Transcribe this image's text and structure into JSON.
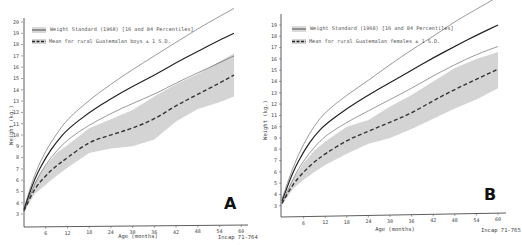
{
  "chart_data": [
    {
      "type": "line",
      "panel": "A",
      "title": "",
      "xlabel": "Age (months)",
      "ylabel": "Weight (kg.)",
      "xlim": [
        0,
        61
      ],
      "ylim": [
        2,
        20
      ],
      "x_ticks": [
        6,
        12,
        18,
        24,
        30,
        36,
        42,
        48,
        54,
        60
      ],
      "y_ticks": [
        3,
        4,
        5,
        6,
        7,
        8,
        9,
        10,
        11,
        12,
        13,
        14,
        15,
        16,
        17,
        18,
        19,
        20
      ],
      "grid": false,
      "legend": [
        "Weight Standard (1968) [16 and 84 Percentiles]",
        "Mean for rural Guatemalan boys ± 1 S.D."
      ],
      "legend_position": "upper left",
      "footer": "Incap 71-764",
      "x": [
        0,
        3,
        6,
        9,
        12,
        18,
        24,
        30,
        36,
        42,
        48,
        54,
        58
      ],
      "series": [
        {
          "name": "Standard 84th percentile",
          "style": "thin solid",
          "values": [
            3.5,
            6.6,
            8.6,
            10.1,
            11.4,
            13.1,
            14.5,
            15.8,
            17.0,
            18.2,
            19.4,
            20.5,
            21.2
          ]
        },
        {
          "name": "Standard 50th percentile",
          "style": "thick solid",
          "values": [
            3.4,
            6.2,
            8.0,
            9.4,
            10.5,
            12.0,
            13.2,
            14.3,
            15.3,
            16.4,
            17.4,
            18.4,
            19.0
          ]
        },
        {
          "name": "Standard 16th percentile",
          "style": "thin solid",
          "values": [
            3.2,
            5.8,
            7.4,
            8.6,
            9.6,
            10.9,
            11.9,
            12.8,
            13.6,
            14.6,
            15.5,
            16.4,
            17.0
          ]
        },
        {
          "name": "Guatemalan boys mean",
          "style": "dashed",
          "values": [
            3.3,
            5.3,
            6.4,
            7.3,
            8.0,
            9.4,
            10.0,
            10.6,
            11.4,
            12.6,
            13.6,
            14.6,
            15.3
          ]
        },
        {
          "name": "Guatemalan boys +1 S.D.",
          "style": "shaded band upper",
          "values": [
            3.4,
            5.8,
            7.3,
            8.4,
            9.1,
            10.6,
            11.4,
            12.2,
            13.4,
            14.5,
            15.4,
            16.5,
            17.2
          ]
        },
        {
          "name": "Guatemalan boys -1 S.D.",
          "style": "shaded band lower",
          "values": [
            3.2,
            4.8,
            5.6,
            6.4,
            7.1,
            8.4,
            8.8,
            9.0,
            9.6,
            11.2,
            12.3,
            12.9,
            13.4
          ]
        }
      ]
    },
    {
      "type": "line",
      "panel": "B",
      "title": "",
      "xlabel": "Age (months)",
      "ylabel": "Weight (kg.)",
      "xlim": [
        0,
        62
      ],
      "ylim": [
        2,
        20
      ],
      "x_ticks": [
        6,
        12,
        18,
        24,
        30,
        36,
        42,
        48,
        54,
        60
      ],
      "y_ticks": [
        3,
        4,
        5,
        6,
        7,
        8,
        9,
        10,
        11,
        12,
        13,
        14,
        15,
        16,
        17,
        18,
        19
      ],
      "grid": false,
      "legend": [
        "Weight Standard (1968) [16 and 84 Percentiles]",
        "Mean for rural Guatemalan females ± 1 S.D."
      ],
      "legend_position": "upper left",
      "footer": "Incap 71-765",
      "x": [
        0,
        3,
        6,
        9,
        12,
        18,
        24,
        30,
        36,
        42,
        48,
        54,
        60
      ],
      "series": [
        {
          "name": "Standard 84th percentile",
          "style": "thin solid",
          "values": [
            3.6,
            6.4,
            8.5,
            10.1,
            11.3,
            12.8,
            14.1,
            15.5,
            16.8,
            18.0,
            19.3,
            20.4,
            21.5
          ]
        },
        {
          "name": "Standard 50th percentile",
          "style": "thick solid",
          "values": [
            3.4,
            6.0,
            7.8,
            9.2,
            10.2,
            11.6,
            12.8,
            13.9,
            15.0,
            16.1,
            17.1,
            18.1,
            19.0
          ]
        },
        {
          "name": "Standard 16th percentile",
          "style": "thin solid",
          "values": [
            3.2,
            5.4,
            7.0,
            8.2,
            9.2,
            10.4,
            11.4,
            12.4,
            13.4,
            14.5,
            15.5,
            16.4,
            17.1
          ]
        },
        {
          "name": "Guatemalan females mean",
          "style": "dashed",
          "values": [
            3.2,
            4.9,
            6.0,
            6.9,
            7.6,
            8.8,
            9.6,
            10.4,
            11.2,
            12.3,
            13.3,
            14.2,
            15.1
          ]
        },
        {
          "name": "Guatemalan females +1 S.D.",
          "style": "shaded band upper",
          "values": [
            3.3,
            5.3,
            6.8,
            7.9,
            8.7,
            10.0,
            10.6,
            11.8,
            12.8,
            14.0,
            15.2,
            16.0,
            16.6
          ]
        },
        {
          "name": "Guatemalan females -1 S.D.",
          "style": "shaded band lower",
          "values": [
            3.1,
            4.5,
            5.3,
            6.0,
            6.6,
            7.6,
            8.5,
            9.0,
            9.8,
            10.7,
            11.6,
            12.4,
            13.4
          ]
        }
      ]
    }
  ],
  "panels": {
    "a": {
      "letter": "A",
      "xlabel": "Age (months)",
      "ylabel": "Weight (kg.)",
      "legend_standard": "Weight Standard (1968) [16 and 84 Percentiles]",
      "legend_mean": "Mean for rural Guatemalan boys ± 1 S.D.",
      "footer": "Incap 71-764",
      "x_tick_labels": [
        "6",
        "12",
        "18",
        "24",
        "30",
        "36",
        "42",
        "48",
        "54",
        "60"
      ],
      "y_tick_labels": [
        "3",
        "4",
        "5",
        "6",
        "7",
        "8",
        "9",
        "10",
        "11",
        "12",
        "13",
        "14",
        "15",
        "16",
        "17",
        "18",
        "19",
        "20"
      ]
    },
    "b": {
      "letter": "B",
      "xlabel": "Age (months)",
      "ylabel": "Weight (kg.)",
      "legend_standard": "Weight Standard (1968) [16 and 84 Percentiles]",
      "legend_mean": "Mean for rural Guatemalan females ± 1 S.D.",
      "footer": "Incap 71-765",
      "x_tick_labels": [
        "6",
        "12",
        "18",
        "24",
        "30",
        "36",
        "42",
        "48",
        "54",
        "60"
      ],
      "y_tick_labels": [
        "3",
        "4",
        "5",
        "6",
        "7",
        "8",
        "9",
        "10",
        "11",
        "12",
        "13",
        "14",
        "15",
        "16",
        "17",
        "18",
        "19"
      ]
    }
  },
  "colors": {
    "line": "#222222",
    "band": "#d0d0d0",
    "text": "#444444"
  }
}
